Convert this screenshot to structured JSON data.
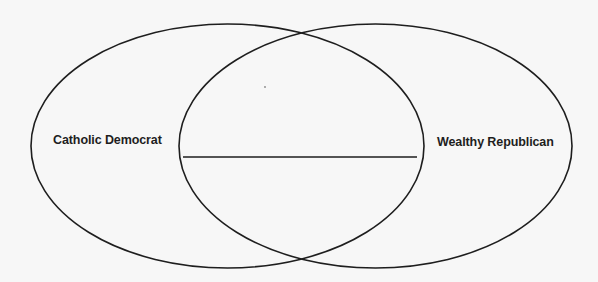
{
  "diagram": {
    "type": "venn",
    "sets": [
      {
        "id": "left",
        "label": "Catholic Democrat",
        "ellipse": {
          "cx": 227.5,
          "cy": 146,
          "rx": 196.5,
          "ry": 122
        }
      },
      {
        "id": "right",
        "label": "Wealthy Republican",
        "ellipse": {
          "cx": 375.5,
          "cy": 146,
          "rx": 196.5,
          "ry": 122
        }
      }
    ],
    "overlap": {
      "answer_line": {
        "x1": 183,
        "y1": 157,
        "x2": 417,
        "y2": 157
      },
      "answer_text": ""
    },
    "colors": {
      "background": "#f7f7f7",
      "stroke": "#1e1e1e",
      "text": "#1e1e1e"
    }
  }
}
